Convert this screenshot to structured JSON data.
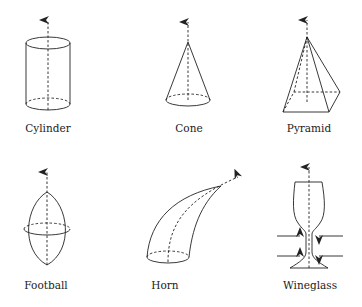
{
  "shapes": [
    {
      "id": "cylinder",
      "label": "Cylinder",
      "label_x": 48,
      "label_y": 122
    },
    {
      "id": "cone",
      "label": "Cone",
      "label_x": 189,
      "label_y": 122
    },
    {
      "id": "pyramid",
      "label": "Pyramid",
      "label_x": 309,
      "label_y": 122
    },
    {
      "id": "football",
      "label": "Football",
      "label_x": 46,
      "label_y": 279
    },
    {
      "id": "horn",
      "label": "Horn",
      "label_x": 165,
      "label_y": 279
    },
    {
      "id": "wineglass",
      "label": "Wineglass",
      "label_x": 310,
      "label_y": 279
    }
  ],
  "colors": {
    "stroke": "#222222",
    "background": "#ffffff"
  }
}
